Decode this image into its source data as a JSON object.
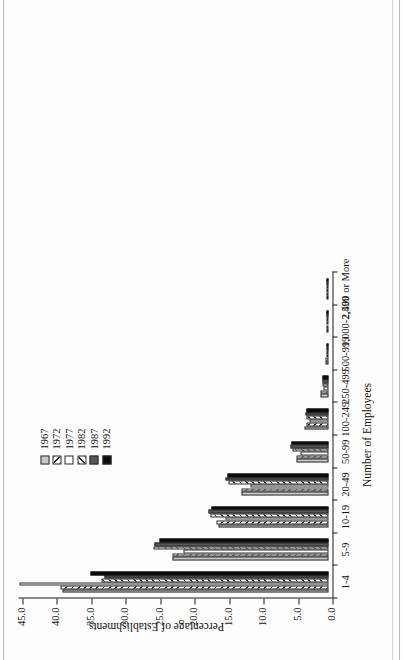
{
  "figure": {
    "background": "#fdfdfd",
    "rotation_note": "page scanned sideways; chart rendered rotated -90deg"
  },
  "legend": {
    "position": "upper-center-left",
    "entries": [
      {
        "label": "1967",
        "pattern": "solid-light-gray",
        "color": "#c9c9c9"
      },
      {
        "label": "1972",
        "pattern": "backward-hatch",
        "color": "#1f1f1f"
      },
      {
        "label": "1977",
        "pattern": "white",
        "color": "#ffffff"
      },
      {
        "label": "1982",
        "pattern": "forward-hatch",
        "color": "#1f1f1f"
      },
      {
        "label": "1987",
        "pattern": "solid-dark-gray",
        "color": "#575757"
      },
      {
        "label": "1992",
        "pattern": "solid-black",
        "color": "#0d0d0d"
      }
    ]
  },
  "chart_data": {
    "type": "bar",
    "title": "",
    "xlabel": "Number of Employees",
    "ylabel": "Percentage of Establishments",
    "ylim": [
      0.0,
      45.0
    ],
    "ytick_step": 5.0,
    "ytick_labels": [
      "0.0",
      "5.0",
      "10.0",
      "15.0",
      "20.0",
      "25.0",
      "30.0",
      "35.0",
      "40.0",
      "45.0"
    ],
    "ytick_values": [
      0.0,
      5.0,
      10.0,
      15.0,
      20.0,
      25.0,
      30.0,
      35.0,
      40.0,
      45.0
    ],
    "grid": false,
    "legend_position": "upper-left",
    "categories": [
      "1-4",
      "5-9",
      "10-19",
      "20-49",
      "50-99",
      "100-249",
      "250-499",
      "500-999",
      "1,000-2,499",
      "2,500 or More"
    ],
    "series": [
      {
        "name": "1967",
        "values": [
          38.6,
          22.6,
          16.0,
          12.6,
          4.6,
          3.5,
          1.2,
          0.5,
          0.3,
          0.1
        ]
      },
      {
        "name": "1972",
        "values": [
          38.9,
          22.7,
          16.3,
          12.7,
          4.6,
          3.2,
          1.1,
          0.4,
          0.2,
          0.1
        ]
      },
      {
        "name": "1977",
        "values": [
          44.9,
          21.0,
          15.0,
          11.3,
          4.0,
          2.7,
          0.8,
          0.3,
          0.1,
          0.05
        ]
      },
      {
        "name": "1982",
        "values": [
          33.0,
          25.4,
          17.2,
          14.5,
          5.3,
          3.2,
          0.9,
          0.3,
          0.15,
          0.05
        ]
      },
      {
        "name": "1987",
        "values": [
          32.5,
          25.3,
          17.4,
          14.9,
          5.5,
          3.3,
          0.9,
          0.3,
          0.15,
          0.05
        ]
      },
      {
        "name": "1992",
        "values": [
          34.6,
          24.6,
          17.0,
          14.6,
          5.4,
          3.2,
          0.9,
          0.3,
          0.15,
          0.05
        ]
      }
    ]
  }
}
